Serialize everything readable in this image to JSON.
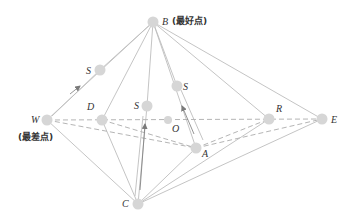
{
  "diagram": {
    "type": "simplex-optimization",
    "colors": {
      "line": "#bdbdbd",
      "dashed": "#b5b5b5",
      "point": "#d6d6d6",
      "arrow": "#7a7a7a",
      "text": "#333333"
    },
    "points": [
      {
        "id": "B",
        "label": "B",
        "x": 153,
        "y": 22,
        "annotation": "(最好点)"
      },
      {
        "id": "W",
        "label": "W",
        "x": 47,
        "y": 120,
        "annotation": "(最差点)"
      },
      {
        "id": "D",
        "label": "D",
        "x": 102,
        "y": 120
      },
      {
        "id": "S1",
        "label": "S",
        "x": 100,
        "y": 70
      },
      {
        "id": "S2",
        "label": "S",
        "x": 147,
        "y": 106
      },
      {
        "id": "S3",
        "label": "S",
        "x": 177,
        "y": 86
      },
      {
        "id": "O",
        "label": "O",
        "x": 168,
        "y": 120
      },
      {
        "id": "R",
        "label": "R",
        "x": 269,
        "y": 119
      },
      {
        "id": "E",
        "label": "E",
        "x": 322,
        "y": 119
      },
      {
        "id": "A",
        "label": "A",
        "x": 196,
        "y": 148
      },
      {
        "id": "C",
        "label": "C",
        "x": 138,
        "y": 204
      }
    ],
    "labels": {
      "B": "B",
      "B_note": "(最好点)",
      "W": "W",
      "W_note": "(最差点)",
      "D": "D",
      "S1": "S",
      "S2": "S",
      "S3": "S",
      "O": "O",
      "R": "R",
      "E": "E",
      "A": "A",
      "C": "C"
    },
    "solid_edges": [
      [
        "B",
        "W"
      ],
      [
        "B",
        "S1"
      ],
      [
        "B",
        "D"
      ],
      [
        "B",
        "S2"
      ],
      [
        "B",
        "S3"
      ],
      [
        "B",
        "A"
      ],
      [
        "B",
        "R"
      ],
      [
        "B",
        "E"
      ],
      [
        "C",
        "W"
      ],
      [
        "C",
        "D"
      ],
      [
        "C",
        "S2"
      ],
      [
        "C",
        "A"
      ],
      [
        "C",
        "R"
      ],
      [
        "C",
        "E"
      ]
    ],
    "dashed_edges": [
      [
        "W",
        "E"
      ],
      [
        "W",
        "A"
      ],
      [
        "D",
        "A"
      ],
      [
        "A",
        "R"
      ],
      [
        "A",
        "E"
      ]
    ],
    "arrows": [
      {
        "from": [
          70,
          94
        ],
        "to": [
          80,
          86
        ]
      },
      {
        "from": [
          140,
          190
        ],
        "to": [
          145,
          124
        ]
      },
      {
        "from": [
          194,
          134
        ],
        "to": [
          182,
          106
        ]
      }
    ]
  }
}
